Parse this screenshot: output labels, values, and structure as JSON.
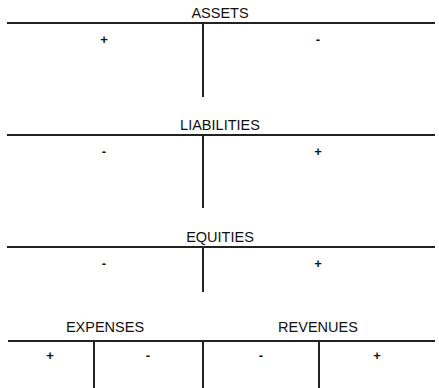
{
  "accounts": [
    {
      "name": "ASSETS",
      "left_sign": "+",
      "right_sign": "-"
    },
    {
      "name": "LIABILITIES",
      "left_sign": "-",
      "right_sign": "+"
    },
    {
      "name": "EQUITIES",
      "left_sign": "-",
      "right_sign": "+"
    },
    {
      "name": "EXPENSES",
      "left_sign": "+",
      "right_sign": "-"
    },
    {
      "name": "REVENUES",
      "left_sign": "-",
      "right_sign": "+"
    }
  ]
}
